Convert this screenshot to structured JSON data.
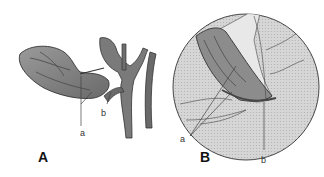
{
  "figure": {
    "panels": [
      {
        "id": "A",
        "label": "A",
        "callouts": [
          {
            "label": "a"
          },
          {
            "label": "b"
          }
        ]
      },
      {
        "id": "B",
        "label": "B",
        "callouts": [
          {
            "label": "a"
          },
          {
            "label": "b"
          }
        ]
      }
    ],
    "colors": {
      "organ_fill": "#8a8a8a",
      "organ_dark": "#555555",
      "vessel_fill": "#707070",
      "circle_fill": "#d4d4d4",
      "outline": "#333333",
      "leader_line": "#555555"
    }
  }
}
